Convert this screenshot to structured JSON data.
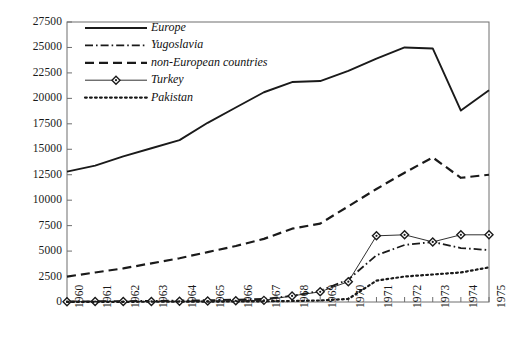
{
  "chart_data": {
    "type": "line",
    "title": "",
    "xlabel": "",
    "ylabel": "",
    "x": [
      1960,
      1961,
      1962,
      1963,
      1964,
      1965,
      1966,
      1967,
      1968,
      1969,
      1970,
      1971,
      1972,
      1973,
      1974,
      1975
    ],
    "categories": [
      "1960",
      "1961",
      "1962",
      "1963",
      "1964",
      "1965",
      "1966",
      "1967",
      "1968",
      "1969",
      "1970",
      "1971",
      "1972",
      "1973",
      "1974",
      "1975"
    ],
    "xlim": [
      1960,
      1975
    ],
    "ylim": [
      0,
      27500
    ],
    "yticks": [
      0,
      2500,
      5000,
      7500,
      10000,
      12500,
      15000,
      17500,
      20000,
      22500,
      25000,
      27500
    ],
    "ytick_labels": [
      "0",
      "2500",
      "5000",
      "7500",
      "10000",
      "12500",
      "15000",
      "17500",
      "20000",
      "22500",
      "25000",
      "27500"
    ],
    "grid": false,
    "legend_position": "upper-left-inside",
    "series": [
      {
        "name": "Europe",
        "style": "solid",
        "color": "#1a1a1a",
        "marker": "none",
        "values": [
          12800,
          13400,
          14300,
          15100,
          15900,
          17600,
          19100,
          20600,
          21600,
          21700,
          22700,
          23900,
          25000,
          24900,
          18800,
          20800
        ]
      },
      {
        "name": "Yugoslavia",
        "style": "dash-dot",
        "color": "#1a1a1a",
        "marker": "none",
        "values": [
          60,
          70,
          90,
          110,
          140,
          180,
          230,
          300,
          600,
          1100,
          2200,
          4600,
          5600,
          5900,
          5300,
          5100
        ]
      },
      {
        "name": "non-European countries",
        "style": "dashed",
        "color": "#1a1a1a",
        "marker": "none",
        "values": [
          2500,
          2900,
          3300,
          3800,
          4300,
          4900,
          5500,
          6200,
          7200,
          7700,
          9400,
          11100,
          12700,
          14200,
          12200,
          12500
        ]
      },
      {
        "name": "Turkey",
        "style": "solid-marker",
        "color": "#1a1a1a",
        "marker": "diamond",
        "values": [
          30,
          40,
          50,
          60,
          70,
          90,
          120,
          160,
          600,
          1000,
          2000,
          6500,
          6600,
          5900,
          6600,
          6600
        ]
      },
      {
        "name": "Pakistan",
        "style": "dotted",
        "color": "#1a1a1a",
        "marker": "none",
        "values": [
          10,
          15,
          20,
          25,
          30,
          40,
          50,
          70,
          100,
          150,
          300,
          2100,
          2500,
          2700,
          2900,
          3400
        ]
      }
    ]
  },
  "legend": {
    "items": [
      {
        "label": "Europe",
        "key": "legend-item-europe"
      },
      {
        "label": "Yugoslavia",
        "key": "legend-item-yugoslavia"
      },
      {
        "label": "non-European countries",
        "key": "legend-item-non-european"
      },
      {
        "label": "Turkey",
        "key": "legend-item-turkey"
      },
      {
        "label": "Pakistan",
        "key": "legend-item-pakistan"
      }
    ]
  }
}
